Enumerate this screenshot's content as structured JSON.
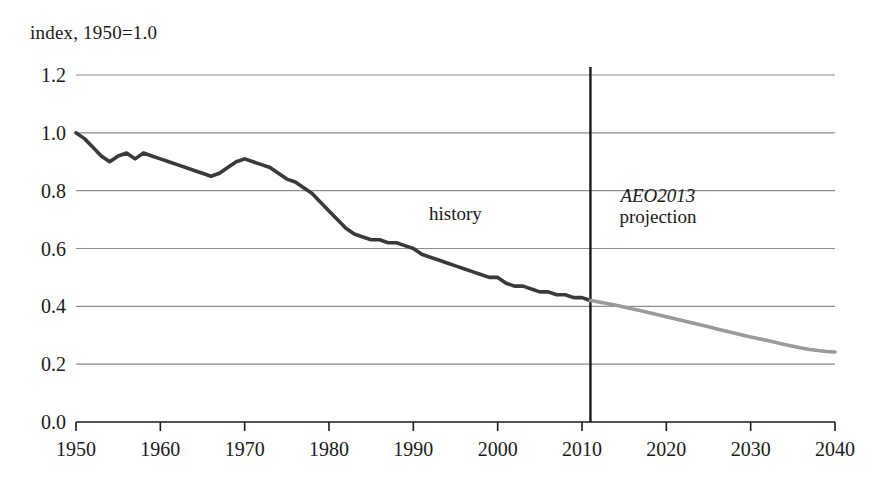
{
  "chart_data": {
    "type": "line",
    "title": "index, 1950=1.0",
    "xlabel": "",
    "ylabel": "index, 1950=1.0",
    "xlim": [
      1950,
      2040
    ],
    "ylim": [
      0.0,
      1.2
    ],
    "grid": true,
    "legend_position": "none",
    "x_ticks": [
      "1950",
      "1960",
      "1970",
      "1980",
      "1990",
      "2000",
      "2010",
      "2020",
      "2030",
      "2040"
    ],
    "y_ticks": [
      "0.0",
      "0.2",
      "0.4",
      "0.6",
      "0.8",
      "1.0",
      "1.2"
    ],
    "annotations": [
      {
        "text": "history",
        "x": 1995,
        "y": 0.72,
        "style": "normal"
      },
      {
        "text": "AEO2013",
        "x": 2019,
        "y": 0.78,
        "style": "italic"
      },
      {
        "text": "projection",
        "x": 2019,
        "y": 0.71,
        "style": "normal"
      }
    ],
    "divider_year": 2011,
    "colors": {
      "history_line": "#3a3a3a",
      "projection_line": "#9a9a9a",
      "grid": "#8c8c8c",
      "axis": "#1a1a1a"
    },
    "series": [
      {
        "name": "history",
        "color": "#3a3a3a",
        "x": [
          1950,
          1951,
          1952,
          1953,
          1954,
          1955,
          1956,
          1957,
          1958,
          1959,
          1960,
          1961,
          1962,
          1963,
          1964,
          1965,
          1966,
          1967,
          1968,
          1969,
          1970,
          1971,
          1972,
          1973,
          1974,
          1975,
          1976,
          1977,
          1978,
          1979,
          1980,
          1981,
          1982,
          1983,
          1984,
          1985,
          1986,
          1987,
          1988,
          1989,
          1990,
          1991,
          1992,
          1993,
          1994,
          1995,
          1996,
          1997,
          1998,
          1999,
          2000,
          2001,
          2002,
          2003,
          2004,
          2005,
          2006,
          2007,
          2008,
          2009,
          2010,
          2011
        ],
        "values": [
          1.0,
          0.98,
          0.95,
          0.92,
          0.9,
          0.92,
          0.93,
          0.91,
          0.93,
          0.92,
          0.91,
          0.9,
          0.89,
          0.88,
          0.87,
          0.86,
          0.85,
          0.86,
          0.88,
          0.9,
          0.91,
          0.9,
          0.89,
          0.88,
          0.86,
          0.84,
          0.83,
          0.81,
          0.79,
          0.76,
          0.73,
          0.7,
          0.67,
          0.65,
          0.64,
          0.63,
          0.63,
          0.62,
          0.62,
          0.61,
          0.6,
          0.58,
          0.57,
          0.56,
          0.55,
          0.54,
          0.53,
          0.52,
          0.51,
          0.5,
          0.5,
          0.48,
          0.47,
          0.47,
          0.46,
          0.45,
          0.45,
          0.44,
          0.44,
          0.43,
          0.43,
          0.42
        ]
      },
      {
        "name": "AEO2013 projection",
        "color": "#9a9a9a",
        "x": [
          2011,
          2012,
          2013,
          2014,
          2015,
          2016,
          2017,
          2018,
          2019,
          2020,
          2021,
          2022,
          2023,
          2024,
          2025,
          2026,
          2027,
          2028,
          2029,
          2030,
          2031,
          2032,
          2033,
          2034,
          2035,
          2036,
          2037,
          2038,
          2039,
          2040
        ],
        "values": [
          0.42,
          0.415,
          0.41,
          0.404,
          0.398,
          0.391,
          0.385,
          0.378,
          0.371,
          0.364,
          0.357,
          0.35,
          0.343,
          0.336,
          0.329,
          0.322,
          0.315,
          0.308,
          0.301,
          0.294,
          0.288,
          0.282,
          0.275,
          0.268,
          0.262,
          0.256,
          0.251,
          0.247,
          0.244,
          0.242
        ]
      }
    ]
  }
}
